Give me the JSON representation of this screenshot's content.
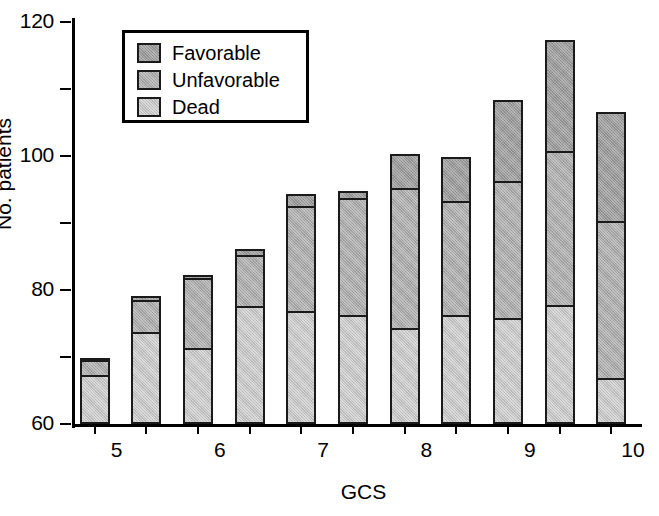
{
  "chart_data": {
    "type": "bar",
    "subtype": "stacked",
    "title": "",
    "xlabel": "GCS",
    "ylabel": "No. patients",
    "categories": [
      "5",
      "6",
      "7",
      "8",
      "9",
      "10",
      "11",
      "12",
      "13",
      "14",
      "15"
    ],
    "ylim": [
      0,
      120
    ],
    "yticks": [
      0,
      20,
      40,
      60,
      80,
      100,
      120
    ],
    "grid": false,
    "legend_position": "upper-left-inside",
    "series": [
      {
        "name": "Dead",
        "color": "#c2c2c2",
        "values": [
          14,
          27,
          22,
          34.5,
          33,
          32,
          28,
          32,
          31,
          35,
          13
        ]
      },
      {
        "name": "Unfavorable",
        "color": "#a8a8a8",
        "values": [
          4.5,
          9.5,
          21,
          15.5,
          31.5,
          35,
          42,
          34,
          41,
          46,
          47
        ]
      },
      {
        "name": "Favorable",
        "color": "#9a9a9a",
        "values": [
          0.5,
          1,
          1,
          1.5,
          3.5,
          2,
          10,
          13,
          24,
          33,
          32.5
        ]
      }
    ],
    "totals": [
      19,
      37.5,
      44,
      51.5,
      68,
      69,
      80,
      79,
      96,
      114,
      92.5
    ]
  },
  "legend": {
    "items": [
      {
        "label": "Favorable",
        "swatch": "favorable"
      },
      {
        "label": "Unfavorable",
        "swatch": "unfavorable"
      },
      {
        "label": "Dead",
        "swatch": "dead"
      }
    ]
  },
  "caption": ""
}
